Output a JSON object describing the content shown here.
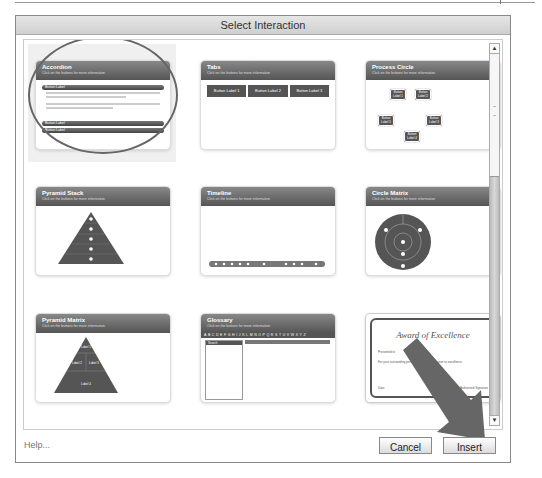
{
  "window": {
    "title": "Select Interaction"
  },
  "tiles": [
    {
      "name": "Accordion",
      "subtitle": "Click on the buttons for more information",
      "selected": true,
      "button_labels": [
        "Button Label",
        "Button Label",
        "Button Label"
      ]
    },
    {
      "name": "Tabs",
      "subtitle": "Click on the buttons for more information",
      "button_labels": [
        "Button Label 1",
        "Button Label 2",
        "Button Label 3"
      ]
    },
    {
      "name": "Process Circle",
      "subtitle": "Click on the buttons for more information",
      "node_labels": [
        "Button Label 1",
        "Button Label 2",
        "Button Label 3",
        "Button Label 4",
        "Button Label 5"
      ]
    },
    {
      "name": "Pyramid Stack",
      "subtitle": "Click on the buttons for more information"
    },
    {
      "name": "Timeline",
      "subtitle": "Click on the buttons for more information"
    },
    {
      "name": "Circle Matrix",
      "subtitle": "Click on the buttons for more information"
    },
    {
      "name": "Pyramid Matrix",
      "subtitle": "Click on the buttons for more information",
      "level_labels": [
        "Label 1",
        "Label 2",
        "Label 3",
        "Label 4"
      ]
    },
    {
      "name": "Glossary",
      "subtitle": "Click on the buttons for more information",
      "alphabet": "ABCDEFGHIJKLMNOPQRSTUVWXYZ",
      "search_label": "Search"
    },
    {
      "name": "Certificate",
      "title": "Award of Excellence",
      "presented_to": "Presented to",
      "body": "For your outstanding performance and dedication to excellence",
      "date_label": "Date",
      "signature_label": "Authorized Signature"
    }
  ],
  "footer": {
    "help": "Help...",
    "cancel": "Cancel",
    "insert": "Insert"
  },
  "colors": {
    "header": "#555555",
    "panel_bg": "#ffffff",
    "window_border": "#888888"
  }
}
